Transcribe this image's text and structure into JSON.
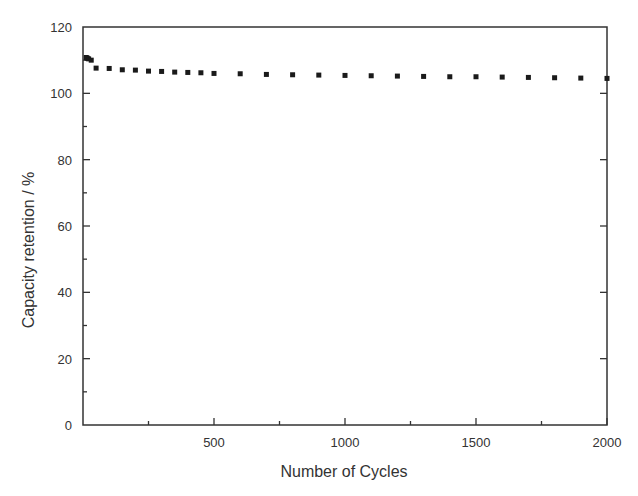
{
  "chart_data": {
    "type": "scatter",
    "title": "",
    "xlabel": "Number of Cycles",
    "ylabel": "Capacity retention / %",
    "xlim": [
      0,
      2000
    ],
    "ylim": [
      0,
      120
    ],
    "x_ticks": [
      500,
      1000,
      1500,
      2000
    ],
    "x_tick_labels": [
      "500",
      "1000",
      "1500",
      "2000"
    ],
    "x_minor_ticks": [
      250,
      750,
      1250,
      1750
    ],
    "y_ticks": [
      0,
      20,
      40,
      60,
      80,
      100,
      120
    ],
    "y_tick_labels": [
      "0",
      "20",
      "40",
      "60",
      "80",
      "100",
      "120"
    ],
    "y_minor_ticks": [
      10,
      30,
      50,
      70,
      90,
      110
    ],
    "grid": false,
    "legend": null,
    "marker": "square",
    "marker_color": "#1a1a1a",
    "series": [
      {
        "name": "Capacity retention",
        "x": [
          1,
          5,
          10,
          20,
          50,
          100,
          150,
          200,
          250,
          300,
          350,
          400,
          450,
          500,
          600,
          700,
          800,
          900,
          1000,
          1100,
          1200,
          1300,
          1400,
          1500,
          1600,
          1700,
          1800,
          1900,
          2000
        ],
        "y": [
          110.8,
          110.6,
          110.4,
          110.0,
          107.6,
          107.5,
          107.1,
          107.0,
          106.7,
          106.6,
          106.4,
          106.3,
          106.2,
          106.0,
          105.9,
          105.7,
          105.6,
          105.5,
          105.4,
          105.3,
          105.2,
          105.1,
          105.0,
          105.0,
          104.9,
          104.8,
          104.7,
          104.6,
          104.5
        ]
      }
    ]
  },
  "layout": {
    "plot_left": 83,
    "plot_right": 607,
    "plot_top": 27,
    "plot_bottom": 425,
    "axis_color": "#333333"
  }
}
